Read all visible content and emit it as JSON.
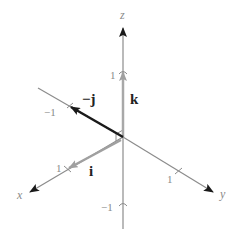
{
  "diagram": {
    "type": "3d-coordinate-axes-unit-vectors",
    "axes": {
      "x": {
        "label": "x",
        "tick_label": "1"
      },
      "y": {
        "label": "y",
        "tick_label": "1"
      },
      "z": {
        "label": "z",
        "tick_label_pos": "1",
        "tick_label_neg": "−1"
      },
      "neg_y_tick_label": "−1"
    },
    "vectors": [
      {
        "name": "i",
        "label": "i",
        "color": "#9a9a9a"
      },
      {
        "name": "neg-j",
        "label": "−j",
        "color": "#1a1a1a"
      },
      {
        "name": "k",
        "label": "k",
        "color": "#a8a8a8"
      }
    ],
    "colors": {
      "axis": "#8c8c8c",
      "background": "#ffffff"
    }
  }
}
